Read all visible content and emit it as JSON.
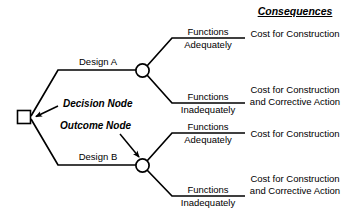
{
  "diagram": {
    "colors": {
      "line": "#000000",
      "background": "#ffffff",
      "text": "#000000"
    },
    "nodes": {
      "decision_node_label": "Decision Node",
      "outcome_node_label": "Outcome Node",
      "decision_node_shape": "square",
      "outcome_node_shape": "circle"
    },
    "decisions": [
      {
        "label": "Design A"
      },
      {
        "label": "Design B"
      }
    ],
    "outcomes": {
      "functions_word": "Functions",
      "adequately_word": "Adequately",
      "inadequately_word": "Inadequately"
    },
    "branches": [
      {
        "decision": "Design A",
        "outcome_top": "Functions",
        "outcome_bottom": "Adequately",
        "consequence": "Cost for Construction"
      },
      {
        "decision": "Design A",
        "outcome_top": "Functions",
        "outcome_bottom": "Inadequately",
        "consequence": "Cost for Construction and Corrective Action"
      },
      {
        "decision": "Design B",
        "outcome_top": "Functions",
        "outcome_bottom": "Adequately",
        "consequence": "Cost for Construction"
      },
      {
        "decision": "Design B",
        "outcome_top": "Functions",
        "outcome_bottom": "Inadequately",
        "consequence": "Cost for Construction and Corrective Action"
      }
    ],
    "consequences_header": "Consequences"
  }
}
